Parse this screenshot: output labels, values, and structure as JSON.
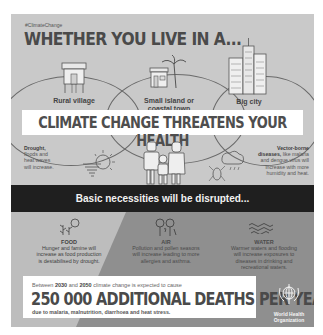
{
  "header": {
    "hashtag": "#ClimateChange",
    "title": "WHETHER YOU LIVE IN A..."
  },
  "places": [
    {
      "label": "Rural village",
      "icon": "stilt-house-icon"
    },
    {
      "label": "Small island or coastal town",
      "label_line1": "Small island or",
      "label_line2": "coastal town",
      "icon": "beach-house-palm-icon"
    },
    {
      "label": "Big city",
      "icon": "skyscrapers-icon"
    }
  ],
  "health_banner": {
    "title": "CLIMATE CHANGE THREATENS YOUR HEALTH"
  },
  "threats": {
    "left": {
      "bold": "Drought,",
      "lines": [
        "floods and",
        "heat waves",
        "will increase."
      ],
      "icon": "sun-tornado-icon"
    },
    "center": {
      "icon": "family-icon"
    },
    "right": {
      "bold_line1": "Vector-borne",
      "bold_line2": "diseases,",
      "line2_rest": " like malaria",
      "lines": [
        "and dengue virus will",
        "increase with more",
        "humidity and heat."
      ],
      "icon": "mosquito-rain-cloud-icon"
    }
  },
  "necessities_banner": {
    "text": "Basic necessities will be disrupted..."
  },
  "necessities": [
    {
      "title": "FOOD",
      "lines": [
        "Hunger and famine will",
        "increase as food production",
        "is destabilised by drought."
      ],
      "icon": "crops-sun-icon"
    },
    {
      "title": "AIR",
      "lines": [
        "Pollution and pollen seasons",
        "will increase leading to more",
        "allergies and asthma."
      ],
      "icon": "trees-wind-icon"
    },
    {
      "title": "WATER",
      "lines": [
        "Warmer waters and flooding",
        "will increase exposures to",
        "diseases in drinking and",
        "recreational waters."
      ],
      "icon": "waves-icon"
    }
  ],
  "deaths": {
    "intro_pre": "Between ",
    "year_start": "2030",
    "intro_mid": " and ",
    "year_end": "2050",
    "intro_post": " climate change is expected to cause",
    "headline": "250 000 ADDITIONAL DEATHS PER YEAR",
    "cause": "due to malaria, malnutrition, diarrhoea and heat stress."
  },
  "organization": {
    "line1": "World Health",
    "line2": "Organization",
    "icon": "who-emblem-icon"
  },
  "colors": {
    "panel": "#c9c9c9",
    "dark_banner": "#1f1f1f",
    "bottom_dark": "#8f8f8f",
    "bottom_light": "#bdbdbd",
    "text_dark": "#4a4a4a"
  }
}
